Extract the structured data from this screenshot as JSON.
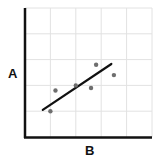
{
  "chart_data": {
    "type": "scatter",
    "title": "",
    "xlabel": "B",
    "ylabel": "A",
    "xlim": [
      0,
      5
    ],
    "ylim": [
      0,
      5
    ],
    "grid": true,
    "tick_labels_shown": false,
    "legend": null,
    "series": [
      {
        "name": "points",
        "kind": "scatter",
        "color": "#6e6e6e",
        "points": [
          {
            "x": 1.0,
            "y": 1.0
          },
          {
            "x": 1.2,
            "y": 1.8
          },
          {
            "x": 2.0,
            "y": 2.0
          },
          {
            "x": 2.6,
            "y": 1.9
          },
          {
            "x": 2.8,
            "y": 2.8
          },
          {
            "x": 3.5,
            "y": 2.4
          }
        ]
      },
      {
        "name": "trend line",
        "kind": "line",
        "color": "#111111",
        "points": [
          {
            "x": 0.7,
            "y": 1.05
          },
          {
            "x": 3.4,
            "y": 2.83
          }
        ]
      }
    ]
  },
  "colors": {
    "axis": "#111111",
    "grid": "#e2e2e2",
    "point": "#6e6e6e",
    "line": "#111111"
  }
}
